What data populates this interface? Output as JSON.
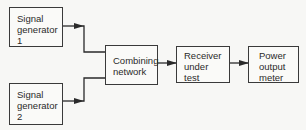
{
  "diagram": {
    "type": "block-diagram",
    "blocks": [
      {
        "id": "sig_gen_1",
        "lines": [
          "Signal",
          "generator",
          "1"
        ]
      },
      {
        "id": "sig_gen_2",
        "lines": [
          "Signal",
          "generator",
          "2"
        ]
      },
      {
        "id": "combining",
        "lines": [
          "Combining",
          "network"
        ]
      },
      {
        "id": "receiver",
        "lines": [
          "Receiver",
          "under",
          "test"
        ]
      },
      {
        "id": "power_meter",
        "lines": [
          "Power",
          "output",
          "meter"
        ]
      }
    ],
    "connections": [
      {
        "from": "sig_gen_1",
        "to": "combining"
      },
      {
        "from": "sig_gen_2",
        "to": "combining"
      },
      {
        "from": "combining",
        "to": "receiver"
      },
      {
        "from": "receiver",
        "to": "power_meter"
      }
    ],
    "colors": {
      "line": "#2a2a2a",
      "background": "#f7f7f5"
    }
  }
}
